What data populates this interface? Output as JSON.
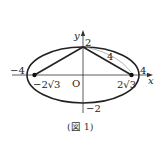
{
  "figure": {
    "caption": "(図 1)",
    "axes": {
      "x_label": "x",
      "y_label": "y",
      "origin_label": "O"
    },
    "labels": {
      "x_neg_vertex": "−4",
      "x_pos_vertex": "4",
      "y_pos_vertex": "2",
      "y_neg_vertex": "−2",
      "focus_left": "−2√3",
      "focus_right": "2√3",
      "segment_length": "4"
    },
    "ellipse": {
      "semi_major": 4,
      "semi_minor": 2,
      "foci": [
        "(−2√3, 0)",
        "(2√3, 0)"
      ]
    },
    "colors": {
      "stroke": "#222222",
      "thin_stroke": "#888888"
    }
  }
}
